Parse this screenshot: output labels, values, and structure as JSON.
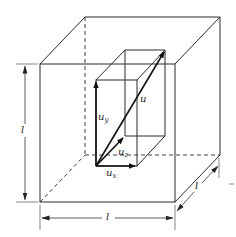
{
  "figure": {
    "colors": {
      "line": "#2a2a2a",
      "background": "#ffffff"
    }
  },
  "labels": {
    "resultant": "u",
    "uy_base": "u",
    "uy_sub": "y",
    "uz_base": "u",
    "uz_sub": "z",
    "ux_base": "u",
    "ux_sub": "x",
    "dim_height": "l",
    "dim_width": "l",
    "dim_depth": "l"
  }
}
